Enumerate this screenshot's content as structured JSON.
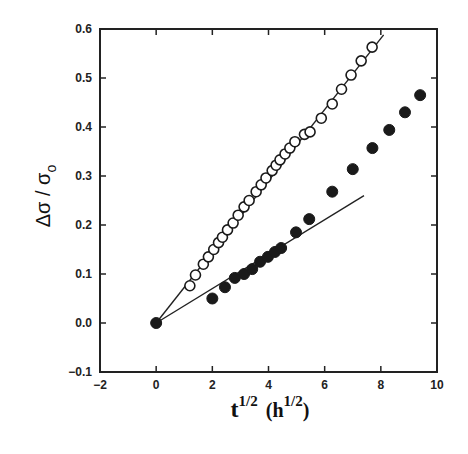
{
  "chart_data": {
    "type": "scatter",
    "title": "",
    "xlabel": "t^1/2 (h^1/2)",
    "xlabel_main": "t",
    "xlabel_sup": "1/2",
    "xlabel_unit_open": "(h",
    "xlabel_unit_sup": "1/2",
    "xlabel_unit_close": ")",
    "ylabel": "Δσ/σo",
    "ylabel_main": "Δσ / σ",
    "ylabel_sub": "o",
    "xlim": [
      -2,
      10
    ],
    "ylim": [
      -0.1,
      0.6
    ],
    "xticks": [
      -2,
      0,
      2,
      4,
      6,
      8,
      10
    ],
    "yticks": [
      -0.1,
      0.0,
      0.1,
      0.2,
      0.3,
      0.4,
      0.5,
      0.6
    ],
    "xtick_labels": [
      "−2",
      "0",
      "2",
      "4",
      "6",
      "8",
      "10"
    ],
    "ytick_labels": [
      "−0.1",
      "0.0",
      "0.1",
      "0.2",
      "0.3",
      "0.4",
      "0.5",
      "0.6"
    ],
    "grid": false,
    "legend": null,
    "series": [
      {
        "name": "open circles",
        "marker": "open-circle",
        "x": [
          1.2,
          1.4,
          1.68,
          1.86,
          2.05,
          2.22,
          2.36,
          2.54,
          2.74,
          2.92,
          3.13,
          3.31,
          3.56,
          3.74,
          3.91,
          4.13,
          4.27,
          4.41,
          4.59,
          4.76,
          4.94,
          5.28,
          5.48,
          5.88,
          6.27,
          6.6,
          6.94,
          7.3,
          7.69
        ],
        "y": [
          0.076,
          0.098,
          0.12,
          0.135,
          0.15,
          0.164,
          0.175,
          0.19,
          0.204,
          0.22,
          0.237,
          0.25,
          0.268,
          0.282,
          0.296,
          0.311,
          0.322,
          0.333,
          0.345,
          0.357,
          0.37,
          0.385,
          0.39,
          0.418,
          0.447,
          0.477,
          0.506,
          0.535,
          0.563
        ]
      },
      {
        "name": "filled circles",
        "marker": "filled-circle",
        "x": [
          0,
          2.0,
          2.45,
          2.8,
          3.13,
          3.42,
          3.7,
          3.98,
          4.23,
          4.45,
          4.98,
          5.45,
          6.27,
          7.0,
          7.7,
          8.3,
          8.86,
          9.4
        ],
        "y": [
          0.0,
          0.05,
          0.073,
          0.092,
          0.1,
          0.11,
          0.125,
          0.135,
          0.145,
          0.153,
          0.185,
          0.212,
          0.268,
          0.314,
          0.357,
          0.394,
          0.43,
          0.465
        ]
      }
    ],
    "fit_lines": [
      {
        "name": "open-circle fit",
        "x": [
          0,
          8.1
        ],
        "y": [
          0.0,
          0.588
        ]
      },
      {
        "name": "filled-circle initial fit",
        "x": [
          0,
          7.4
        ],
        "y": [
          0.0,
          0.26
        ]
      }
    ]
  }
}
